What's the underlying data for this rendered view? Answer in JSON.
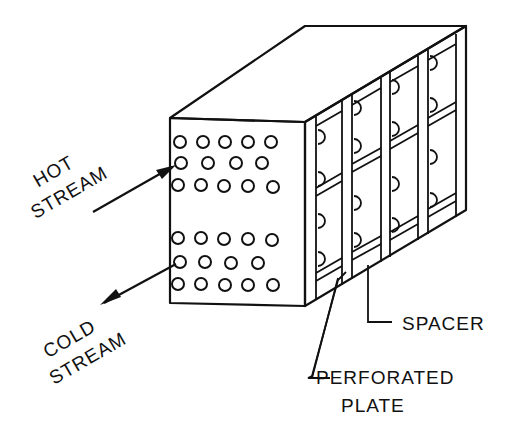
{
  "diagram": {
    "labels": {
      "hot_stream_line1": "HOT",
      "hot_stream_line2": "STREAM",
      "cold_stream_line1": "COLD",
      "cold_stream_line2": "STREAM",
      "spacer": "SPACER",
      "perforated_plate_line1": "PERFORATED",
      "perforated_plate_line2": "PLATE"
    },
    "front_face": {
      "hole_rows_hot": [
        [
          5,
          4,
          5
        ]
      ],
      "hole_rows_cold": [
        [
          5,
          4,
          5
        ]
      ]
    },
    "colors": {
      "ink": "#111111",
      "background": "#ffffff"
    }
  }
}
